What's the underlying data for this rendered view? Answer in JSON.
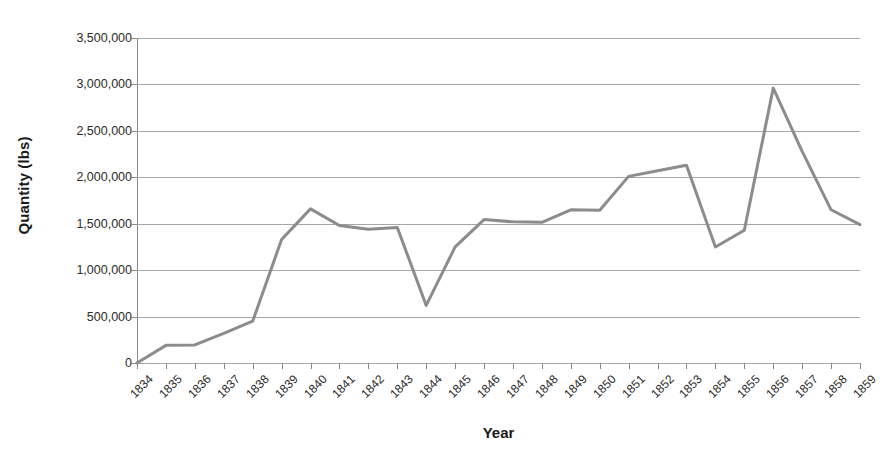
{
  "chart_data": {
    "type": "line",
    "title": "",
    "xlabel": "Year",
    "ylabel": "Quantity (lbs)",
    "categories": [
      "1834",
      "1835",
      "1836",
      "1837",
      "1838",
      "1839",
      "1840",
      "1841",
      "1842",
      "1843",
      "1844",
      "1845",
      "1846",
      "1847",
      "1848",
      "1849",
      "1850",
      "1851",
      "1852",
      "1853",
      "1854",
      "1855",
      "1856",
      "1857",
      "1858",
      "1859"
    ],
    "values": [
      0,
      190000,
      195000,
      320000,
      450000,
      1330000,
      1660000,
      1480000,
      1440000,
      1460000,
      620000,
      1250000,
      1545000,
      1520000,
      1515000,
      1650000,
      1645000,
      2010000,
      2070000,
      2130000,
      1250000,
      1430000,
      2960000,
      2280000,
      1650000,
      1490000
    ],
    "series": [
      {
        "name": "Quantity",
        "color": "#8c8c8c",
        "values": [
          0,
          190000,
          195000,
          320000,
          450000,
          1330000,
          1660000,
          1480000,
          1440000,
          1460000,
          620000,
          1250000,
          1545000,
          1520000,
          1515000,
          1650000,
          1645000,
          2010000,
          2070000,
          2130000,
          1250000,
          1430000,
          2960000,
          2280000,
          1650000,
          1490000
        ]
      }
    ],
    "ylim": [
      0,
      3500000
    ],
    "y_ticks": [
      0,
      500000,
      1000000,
      1500000,
      2000000,
      2500000,
      3000000,
      3500000
    ],
    "y_tick_labels": [
      "0",
      "500,000",
      "1,000,000",
      "1,500,000",
      "2,000,000",
      "2,500,000",
      "3,000,000",
      "3,500,000"
    ],
    "grid": true,
    "legend": false,
    "legend_position": "none",
    "line_color": "#8c8c8c",
    "line_width": 3,
    "grid_color": "#a6a6a6",
    "axis_color": "#8a8a8a",
    "background": "#ffffff"
  }
}
